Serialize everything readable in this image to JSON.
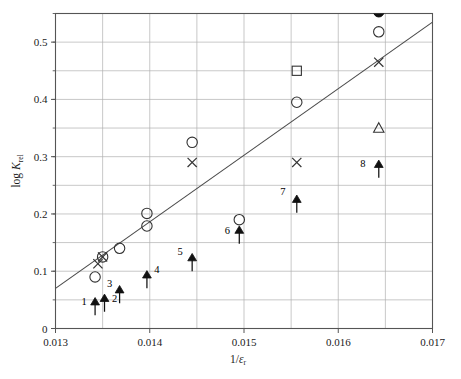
{
  "chart_data": {
    "type": "scatter",
    "title": "",
    "xlabel": "1/εr",
    "ylabel": "log Krel",
    "xlim": [
      0.013,
      0.017
    ],
    "ylim": [
      0.0,
      0.55
    ],
    "grid": true,
    "legend": "none",
    "xticks": [
      "0.013",
      "0.014",
      "0.015",
      "0.016",
      "0.017"
    ],
    "xtick_values": [
      0.013,
      0.014,
      0.015,
      0.016,
      0.017
    ],
    "xminor_step": 0.0005,
    "yticks": [
      "0",
      "0.1",
      "0.2",
      "0.3",
      "0.4",
      "0.5"
    ],
    "ytick_values": [
      0,
      0.1,
      0.2,
      0.3,
      0.4,
      0.5
    ],
    "yminor_step": 0.05,
    "series": [
      {
        "name": "open-circle",
        "marker": "circle-open",
        "points": [
          {
            "x": 0.01342,
            "y": 0.09
          },
          {
            "x": 0.0135,
            "y": 0.125
          },
          {
            "x": 0.01368,
            "y": 0.14
          },
          {
            "x": 0.01397,
            "y": 0.201
          },
          {
            "x": 0.01397,
            "y": 0.179
          },
          {
            "x": 0.01445,
            "y": 0.325
          },
          {
            "x": 0.01495,
            "y": 0.19
          },
          {
            "x": 0.01556,
            "y": 0.395
          },
          {
            "x": 0.01643,
            "y": 0.518
          }
        ]
      },
      {
        "name": "cross",
        "marker": "x-mark",
        "points": [
          {
            "x": 0.01345,
            "y": 0.113
          },
          {
            "x": 0.0135,
            "y": 0.125
          },
          {
            "x": 0.01445,
            "y": 0.29
          },
          {
            "x": 0.01556,
            "y": 0.29
          },
          {
            "x": 0.01643,
            "y": 0.465
          }
        ]
      },
      {
        "name": "open-square",
        "marker": "square-open",
        "points": [
          {
            "x": 0.01556,
            "y": 0.45
          }
        ]
      },
      {
        "name": "open-triangle",
        "marker": "triangle-open",
        "points": [
          {
            "x": 0.01643,
            "y": 0.35
          }
        ]
      },
      {
        "name": "filled-circle",
        "marker": "circle-filled",
        "points": [
          {
            "x": 0.01643,
            "y": 0.553
          }
        ]
      },
      {
        "name": "lower-bounds",
        "marker": "triangle-filled-with-up-arrow",
        "points": [
          {
            "label": "1",
            "x": 0.01342,
            "y": 0.045
          },
          {
            "label": "2",
            "x": 0.01352,
            "y": 0.051
          },
          {
            "label": "3",
            "x": 0.01368,
            "y": 0.066
          },
          {
            "label": "4",
            "x": 0.01397,
            "y": 0.092
          },
          {
            "label": "5",
            "x": 0.01445,
            "y": 0.122
          },
          {
            "label": "6",
            "x": 0.01495,
            "y": 0.17
          },
          {
            "label": "7",
            "x": 0.01556,
            "y": 0.224
          },
          {
            "label": "8",
            "x": 0.01643,
            "y": 0.285
          }
        ]
      }
    ],
    "trendline": {
      "name": "regression-line",
      "x_start": 0.013,
      "y_start": 0.07,
      "x_end": 0.017,
      "y_end": 0.535
    }
  },
  "axes": {
    "y_label_prefix": "log ",
    "y_label_symbol": "K",
    "y_label_subscript": "rel",
    "x_label_numerator": "1/",
    "x_label_symbol": "ε",
    "x_label_subscript": "r"
  },
  "colors": {
    "marker": "#333333",
    "grid": "#b0b0b0",
    "axis": "#555555",
    "line": "#4a4a4a",
    "text": "#1a1a1a"
  }
}
